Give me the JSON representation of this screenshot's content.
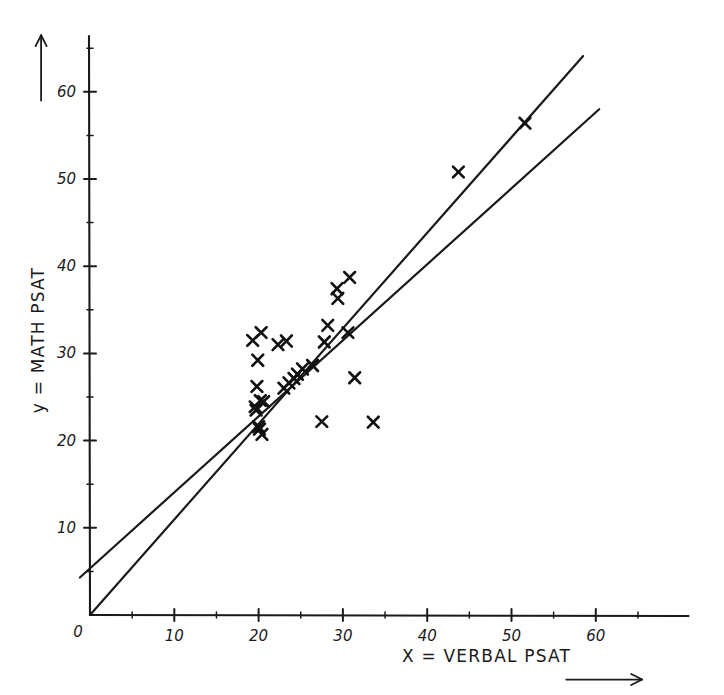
{
  "chart_data": {
    "type": "scatter",
    "title": "",
    "xlabel": "X = VERBAL PSAT",
    "ylabel": "y = MATH PSAT",
    "xlim": [
      0,
      71
    ],
    "ylim": [
      0,
      66
    ],
    "grid": false,
    "legend": null,
    "x_ticks": [
      0,
      10,
      20,
      30,
      40,
      50,
      60
    ],
    "x_tick_labels": [
      "0",
      "10",
      "20",
      "30",
      "40",
      "50",
      "60"
    ],
    "x_minor_ticks": [
      5,
      15,
      25,
      35,
      45,
      55,
      65
    ],
    "y_ticks": [
      10,
      20,
      30,
      40,
      50,
      60
    ],
    "y_tick_labels": [
      "10",
      "20",
      "30",
      "40",
      "50",
      "60"
    ],
    "y_minor_ticks": [
      5,
      15,
      25,
      35,
      45,
      55,
      65
    ],
    "origin_label": "0",
    "marker_style": "x",
    "points": [
      {
        "x": 19.3,
        "y": 31.5
      },
      {
        "x": 20.3,
        "y": 32.4
      },
      {
        "x": 22.3,
        "y": 31.0
      },
      {
        "x": 19.9,
        "y": 29.2
      },
      {
        "x": 23.3,
        "y": 31.4
      },
      {
        "x": 19.8,
        "y": 26.2
      },
      {
        "x": 20.2,
        "y": 24.6
      },
      {
        "x": 20.6,
        "y": 24.5
      },
      {
        "x": 19.6,
        "y": 23.9
      },
      {
        "x": 19.7,
        "y": 23.5
      },
      {
        "x": 20.0,
        "y": 21.6
      },
      {
        "x": 20.1,
        "y": 21.3
      },
      {
        "x": 20.4,
        "y": 20.7
      },
      {
        "x": 23.0,
        "y": 26.0
      },
      {
        "x": 23.6,
        "y": 26.6
      },
      {
        "x": 24.2,
        "y": 27.1
      },
      {
        "x": 24.6,
        "y": 27.6
      },
      {
        "x": 25.2,
        "y": 28.2
      },
      {
        "x": 26.4,
        "y": 28.6
      },
      {
        "x": 27.5,
        "y": 22.2
      },
      {
        "x": 27.8,
        "y": 31.3
      },
      {
        "x": 28.2,
        "y": 33.2
      },
      {
        "x": 29.3,
        "y": 37.4
      },
      {
        "x": 29.4,
        "y": 36.3
      },
      {
        "x": 30.8,
        "y": 38.7
      },
      {
        "x": 30.6,
        "y": 32.4
      },
      {
        "x": 31.4,
        "y": 27.2
      },
      {
        "x": 33.6,
        "y": 22.1
      },
      {
        "x": 43.7,
        "y": 50.8
      },
      {
        "x": 51.6,
        "y": 56.4
      }
    ],
    "fit_lines": [
      {
        "name": "line-through-origin",
        "x0": 0.0,
        "y0": 0.0,
        "x1": 58.5,
        "y1": 64.1
      },
      {
        "name": "least-squares-line",
        "x0": -1.2,
        "y0": 4.3,
        "x1": 60.4,
        "y1": 58.0
      }
    ],
    "x_arrow": {
      "from_x": 56.5,
      "from_y": -7.4,
      "to_x": 65.5,
      "to_y": -7.4
    },
    "y_arrow": {
      "from_x": -5.8,
      "from_y": 59.0,
      "to_x": -5.8,
      "to_y": 66.5
    }
  }
}
